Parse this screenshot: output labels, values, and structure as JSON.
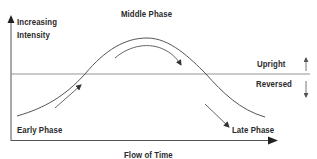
{
  "labels": {
    "y_axis_line1": "Increasing",
    "y_axis_line2": "Intensity",
    "middle_phase": "Middle Phase",
    "upright": "Upright",
    "reversed": "Reversed",
    "early_phase": "Early Phase",
    "late_phase": "Late Phase",
    "x_axis": "Flow of Time"
  },
  "colors": {
    "line": "#555555",
    "text": "#2a2a2a",
    "background": "#ffffff"
  },
  "diagram": {
    "type": "bell-curve-phase-diagram",
    "axes": {
      "x": "Flow of Time",
      "y": "Increasing Intensity"
    },
    "threshold_line": {
      "above": "Upright",
      "below": "Reversed"
    },
    "phases": [
      "Early Phase",
      "Middle Phase",
      "Late Phase"
    ]
  }
}
